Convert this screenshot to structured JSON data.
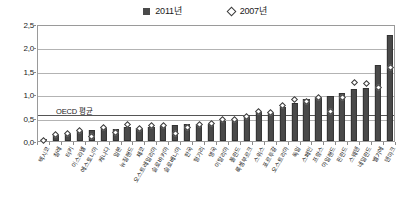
{
  "legend": {
    "position": "top-center",
    "entries": [
      {
        "label": "2011년",
        "marker": "filled-square-icon",
        "color": "#4a4a4a"
      },
      {
        "label": "2007년",
        "marker": "open-diamond-icon",
        "color": "#ffffff"
      }
    ]
  },
  "annotation": {
    "oecd_average_label": "OECD 평균",
    "oecd_average_value": 0.6
  },
  "colors": {
    "bar_2011": "#4a4a4a",
    "marker_2007_stroke": "#3a3a3a",
    "marker_2007_fill": "#ffffff",
    "gridline": "#b3b3b3",
    "frame": "#9a9a9a",
    "oecd_line": "#555555",
    "background": "#ffffff"
  },
  "chart_data": {
    "type": "bar",
    "title": "",
    "subtitle": "",
    "xlabel": "",
    "ylabel": "",
    "ylim": [
      0.0,
      2.5
    ],
    "yticks": [
      0.0,
      0.5,
      1.0,
      1.5,
      2.0,
      2.5
    ],
    "ytick_labels": [
      "0,0",
      "0,5",
      "1,0",
      "1,5",
      "2,0",
      "2,5"
    ],
    "grid": true,
    "legend_position": "top-center",
    "decimal_separator": ",",
    "reference_lines": [
      {
        "label": "OECD 평균",
        "value": 0.6
      }
    ],
    "categories": [
      "멕시코",
      "칠레",
      "터키",
      "이스라엘",
      "에스토니아",
      "캐나다",
      "일본",
      "뉴질랜드",
      "체코",
      "오스트레일리아",
      "슬로바키아",
      "슬로베니아",
      "한국",
      "헝가리",
      "영국",
      "이탈리아",
      "폴란드",
      "룩셈부르크",
      "스위스",
      "포르투갈",
      "오스트리아",
      "독일",
      "스페인",
      "프랑스",
      "아일랜드",
      "핀란드",
      "스웨덴",
      "네덜란드",
      "벨기에",
      "덴마크"
    ],
    "series": [
      {
        "name": "2011년",
        "marker": "bar",
        "values": [
          0.05,
          0.12,
          0.14,
          0.21,
          0.24,
          0.28,
          0.25,
          0.29,
          0.27,
          0.31,
          0.32,
          0.34,
          0.36,
          0.36,
          0.37,
          0.42,
          0.44,
          0.56,
          0.62,
          0.6,
          0.72,
          0.81,
          0.89,
          0.93,
          0.97,
          1.03,
          1.12,
          1.13,
          1.62,
          2.27
        ]
      },
      {
        "name": "2007년",
        "marker": "open-diamond",
        "values": [
          0.02,
          0.14,
          0.16,
          0.23,
          0.1,
          0.29,
          0.18,
          0.35,
          0.27,
          0.33,
          0.34,
          0.15,
          0.29,
          0.36,
          0.38,
          0.46,
          0.46,
          0.52,
          0.63,
          0.61,
          0.75,
          0.88,
          0.84,
          0.94,
          0.64,
          0.93,
          1.25,
          1.22,
          1.14,
          1.58
        ]
      }
    ]
  }
}
